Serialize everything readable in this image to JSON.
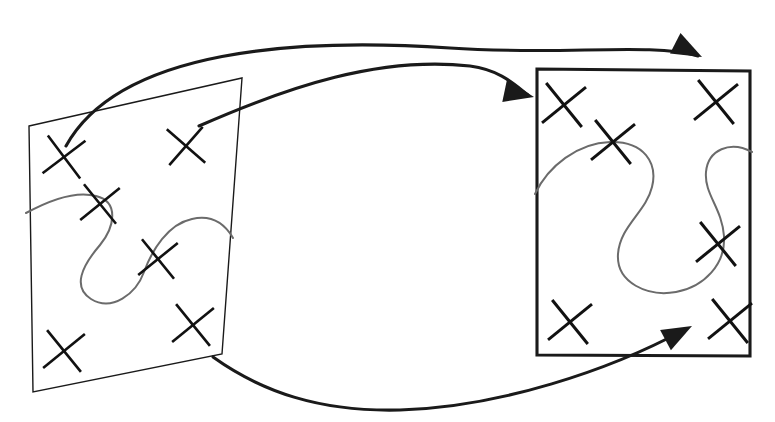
{
  "figure": {
    "background_color": "#ffffff",
    "width": 775,
    "height": 422,
    "stroke_color": "#1a1a1a",
    "curve_color": "#6b6b6b",
    "mark_color": "#111111"
  },
  "panels": [
    {
      "id": "left-patch",
      "name": "left-quadrilateral",
      "shape": "quadrilateral",
      "stroke_width": 1.4,
      "corners": [
        [
          29,
          126
        ],
        [
          242,
          78
        ],
        [
          222,
          354
        ],
        [
          33,
          392
        ]
      ],
      "marked_points": [
        {
          "name": "mark-l1",
          "cx": 64,
          "cy": 157,
          "r": 19,
          "rot": 8
        },
        {
          "name": "mark-l2",
          "cx": 186,
          "cy": 146,
          "r": 18,
          "rot": -4
        },
        {
          "name": "mark-l3",
          "cx": 100,
          "cy": 204,
          "r": 18,
          "rot": 6
        },
        {
          "name": "mark-l4",
          "cx": 158,
          "cy": 259,
          "r": 18,
          "rot": 6
        },
        {
          "name": "mark-l5",
          "cx": 64,
          "cy": 351,
          "r": 19,
          "rot": 6
        },
        {
          "name": "mark-l6",
          "cx": 193,
          "cy": 325,
          "r": 19,
          "rot": 6
        }
      ],
      "embedded_curve": {
        "name": "left-embedded-curve",
        "path": "M 26 213 C 48 201 74 190 96 196 C 120 202 114 228 100 245 C 82 266 72 287 91 299 C 112 312 136 294 144 272 C 152 250 168 224 192 219 C 214 214 226 226 233 238"
      }
    },
    {
      "id": "right-patch",
      "name": "right-rectangle",
      "shape": "rectangle",
      "stroke_width": 3.1,
      "corners": [
        [
          537,
          69
        ],
        [
          750,
          71
        ],
        [
          750,
          356
        ],
        [
          537,
          355
        ]
      ],
      "marked_points": [
        {
          "name": "mark-r1",
          "cx": 564,
          "cy": 105,
          "r": 20,
          "rot": 6
        },
        {
          "name": "mark-r2",
          "cx": 716,
          "cy": 102,
          "r": 20,
          "rot": 6
        },
        {
          "name": "mark-r3",
          "cx": 613,
          "cy": 142,
          "r": 20,
          "rot": 6
        },
        {
          "name": "mark-r4",
          "cx": 718,
          "cy": 244,
          "r": 20,
          "rot": 6
        },
        {
          "name": "mark-r5",
          "cx": 570,
          "cy": 322,
          "r": 20,
          "rot": 6
        },
        {
          "name": "mark-r6",
          "cx": 730,
          "cy": 321,
          "r": 20,
          "rot": 6
        }
      ],
      "embedded_curve": {
        "name": "right-embedded-curve",
        "path": "M 535 194 C 548 166 578 143 610 142 C 644 141 658 163 652 187 C 646 212 620 226 618 254 C 616 283 648 297 676 292 C 704 287 726 264 724 236 C 722 208 704 194 706 172 C 708 150 730 140 752 152"
      }
    }
  ],
  "map_arrows": [
    {
      "name": "top-map-arrow",
      "description": "curve from left patch top-left mark arcing right to right patch top edge",
      "path": "M 66 146 C 120 48 300 38 450 48 C 560 56 650 42 698 56",
      "head": {
        "tip_x": 702,
        "tip_y": 57,
        "angle_deg": 27
      }
    },
    {
      "name": "second-map-arrow",
      "description": "line from left patch upper area rising right then descending into right patch left edge",
      "path": "M 199 126 C 290 86 380 56 470 66 C 500 70 514 84 528 95",
      "head": {
        "tip_x": 534,
        "tip_y": 97,
        "angle_deg": 12
      }
    },
    {
      "name": "bottom-map-arrow",
      "description": "curve from left patch bottom-right corner dipping low and rising into right patch bottom-right mark",
      "path": "M 213 357 C 262 392 320 412 400 410 C 500 407 610 370 684 330",
      "head": {
        "tip_x": 692,
        "tip_y": 326,
        "angle_deg": -28
      }
    }
  ]
}
